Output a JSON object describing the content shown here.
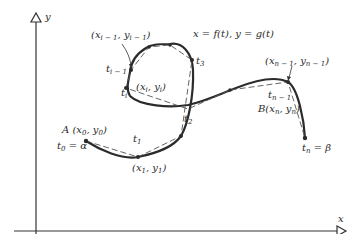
{
  "diagram": {
    "title_equation": "x = f(t),  y = g(t)",
    "axes": {
      "x_label": "x",
      "y_label": "y"
    },
    "points": {
      "A": {
        "name": "A",
        "coord": "(x0, y0)",
        "param": "t0 = α"
      },
      "p1": {
        "coord": "(x1, y1)",
        "param": "t1"
      },
      "p2": {
        "param": "t2"
      },
      "p3": {
        "param": "t3"
      },
      "pim1": {
        "coord": "(xi − 1, yi − 1)",
        "param": "ti − 1"
      },
      "pi": {
        "coord": "(xi, yi)",
        "param": "ti"
      },
      "pnm1": {
        "coord": "(xn − 1, yn − 1)",
        "param": "tn − 1"
      },
      "B": {
        "name": "B",
        "coord": "(xn, yn)",
        "param": "tn = β"
      }
    },
    "colors": {
      "ink": "#2b2b2b",
      "background": "#ffffff"
    }
  }
}
